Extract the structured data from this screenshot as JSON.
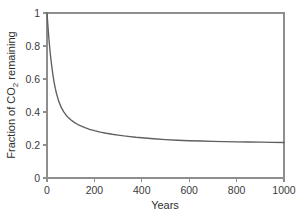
{
  "chart_data": {
    "type": "line",
    "title": "",
    "xlabel": "Years",
    "ylabel": "Fraction of CO2 remaining",
    "ylabel_prefix": "Fraction of CO",
    "ylabel_subscript": "2",
    "ylabel_suffix": " remaining",
    "xlim": [
      0,
      1000
    ],
    "ylim": [
      0,
      1
    ],
    "xticks": [
      0,
      200,
      400,
      600,
      800,
      1000
    ],
    "xtick_labels": [
      "0",
      "200",
      "400",
      "600",
      "800",
      "1000"
    ],
    "yticks": [
      0,
      0.2,
      0.4,
      0.6,
      0.8,
      1
    ],
    "ytick_labels": [
      "0",
      "0.2",
      "0.4",
      "0.6",
      "0.8",
      "1"
    ],
    "grid": false,
    "legend": false,
    "series": [
      {
        "name": "Fraction of CO2 remaining",
        "color": "#5f5f5f",
        "x": [
          0,
          2,
          5,
          8,
          12,
          16,
          20,
          25,
          30,
          35,
          40,
          50,
          60,
          70,
          80,
          90,
          100,
          115,
          130,
          145,
          160,
          180,
          200,
          225,
          250,
          275,
          300,
          325,
          350,
          375,
          400,
          450,
          500,
          550,
          600,
          650,
          700,
          750,
          800,
          850,
          900,
          950,
          1000
        ],
        "y": [
          1.0,
          0.96,
          0.9,
          0.845,
          0.78,
          0.725,
          0.678,
          0.625,
          0.58,
          0.543,
          0.512,
          0.463,
          0.428,
          0.402,
          0.382,
          0.366,
          0.353,
          0.337,
          0.324,
          0.314,
          0.305,
          0.295,
          0.287,
          0.278,
          0.271,
          0.265,
          0.26,
          0.255,
          0.251,
          0.247,
          0.244,
          0.238,
          0.233,
          0.229,
          0.226,
          0.224,
          0.222,
          0.22,
          0.219,
          0.218,
          0.217,
          0.216,
          0.215
        ]
      }
    ]
  },
  "style": {
    "axis_color": "#8e8e8e",
    "curve_color": "#5f5f5f",
    "text_color": "#2e2e2e",
    "background": "#ffffff"
  },
  "layout": {
    "plot_left": 47,
    "plot_right": 284,
    "plot_top": 13,
    "plot_bottom": 178
  }
}
